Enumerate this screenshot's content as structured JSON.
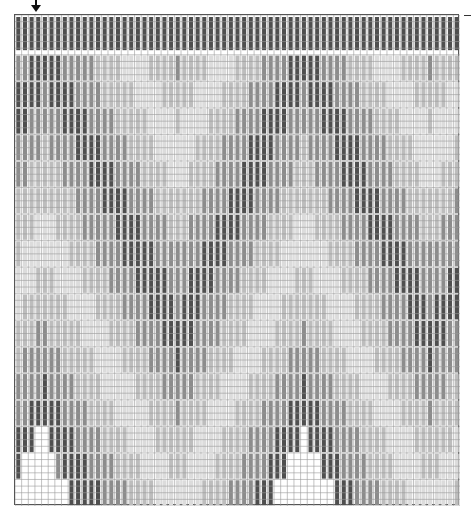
{
  "chart_title": "Bargello stitch chart",
  "start_marker": {
    "icon": "down-arrow-icon",
    "column": 3
  },
  "grid": {
    "columns": 67,
    "rows": 74,
    "cell": 6.63
  },
  "palette": {
    "dark": "#4f4f4f",
    "medium": "#8c8c8c",
    "light": "#bdbdbd",
    "lightest": "#dcdcdc",
    "gridline": "#9a9a9a",
    "background": "#ffffff"
  },
  "pattern": {
    "stitch_length_rows": 4,
    "step_rows": 2,
    "band_order": [
      "dark",
      "medium",
      "light",
      "lightest",
      "light",
      "medium"
    ],
    "peaks": [
      {
        "column": 4,
        "offset": 0
      },
      {
        "column": 24,
        "offset": 42
      },
      {
        "column": 43,
        "offset": 0
      },
      {
        "column": 62,
        "offset": 42
      }
    ],
    "top_edge_rows": 5,
    "bottom_fill_depth_rows": 12
  }
}
